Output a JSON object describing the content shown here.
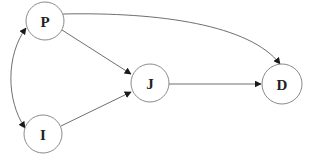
{
  "diagram": {
    "type": "directed-graph",
    "colors": {
      "node_stroke": "#8a8a8a",
      "edge_stroke": "#6f6f6f",
      "arrowhead": "#1a1a1a",
      "label": "#222222",
      "background": "#ffffff"
    },
    "nodes": [
      {
        "id": "P",
        "label": "P",
        "cx": 45,
        "cy": 21,
        "r": 19
      },
      {
        "id": "I",
        "label": "I",
        "cx": 43,
        "cy": 134,
        "r": 19
      },
      {
        "id": "J",
        "label": "J",
        "cx": 150,
        "cy": 83,
        "r": 19
      },
      {
        "id": "D",
        "label": "D",
        "cx": 282,
        "cy": 84,
        "r": 20
      }
    ],
    "edges": [
      {
        "from": "P",
        "to": "J",
        "style": "straight",
        "directed": true
      },
      {
        "from": "I",
        "to": "J",
        "style": "straight",
        "directed": true
      },
      {
        "from": "J",
        "to": "D",
        "style": "straight",
        "directed": true
      },
      {
        "from": "P",
        "to": "D",
        "style": "curved",
        "directed": true
      },
      {
        "from": "P",
        "to": "I",
        "style": "curved",
        "directed": true,
        "bidirectional": true
      }
    ]
  }
}
